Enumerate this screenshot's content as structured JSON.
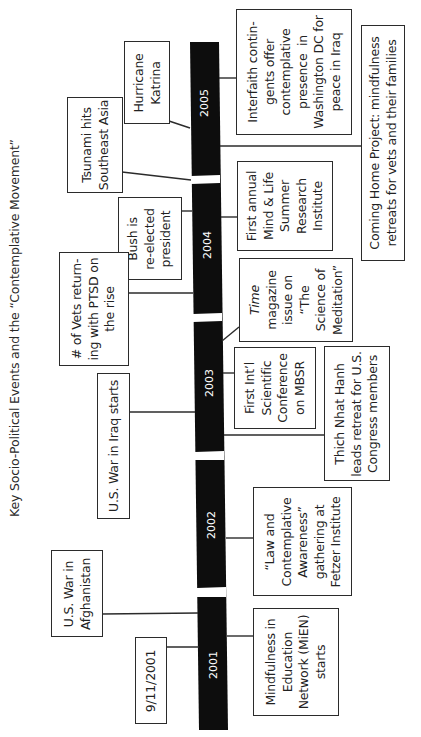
{
  "colors": {
    "bar": "#0d0d0d",
    "box_border": "#2b2b2b",
    "text": "#222222",
    "year_text": "#ffffff"
  },
  "timeline": {
    "years": [
      "2001",
      "2002",
      "2003",
      "2004",
      "2005"
    ]
  },
  "socio_political_events": [
    {
      "id": "katrina",
      "year": "2005",
      "label": "Hurricane\nKatrina"
    },
    {
      "id": "tsunami",
      "year": "2004/2005",
      "label": "Tsunami hits\nSoutheast Asia"
    },
    {
      "id": "bush",
      "year": "2004",
      "label": "Bush is\nre-elected\npresident"
    },
    {
      "id": "vets",
      "year": "2004",
      "label": "# of Vets return-\ning with PTSD on\nthe rise"
    },
    {
      "id": "iraq",
      "year": "2003",
      "label": "U.S. War in Iraq starts"
    },
    {
      "id": "afghanistan",
      "year": "2001",
      "label": "U.S. War in\nAfghanistan"
    },
    {
      "id": "nine-eleven",
      "year": "2001",
      "label": "9/11/2001"
    }
  ],
  "contemplative_events": [
    {
      "id": "interfaith",
      "year": "2005",
      "label": "Interfaith contin-\ngents offer\ncontemplative\npresence  in\nWashington DC for\npeace in Iraq"
    },
    {
      "id": "coming-home",
      "year": "2005",
      "label": "Coming Home Project: mindfulness\nretreats for vets and their families"
    },
    {
      "id": "mind-life",
      "year": "2004",
      "label": "First annual\nMind & Life\nSummer\nResearch\nInstitute"
    },
    {
      "id": "time-mag",
      "year": "2003",
      "label_italic": "Time",
      "label": "magazine\nissue on\n“The\nScience of\nMeditation”"
    },
    {
      "id": "mbsr",
      "year": "2003",
      "label": "First Int’l\nScientific\nConference\non MBSR"
    },
    {
      "id": "thich",
      "year": "2003",
      "label": "Thich Nhat Hanh\nleads retreat for U.S.\nCongress members"
    },
    {
      "id": "law",
      "year": "2002",
      "label": "“Law and\nContemplative\nAwareness”\ngathering at\nFetzer Institute"
    },
    {
      "id": "mien",
      "year": "2001",
      "label": "Mindfulness in\nEducation\nNetwork (MiEN)\nstarts"
    }
  ]
}
